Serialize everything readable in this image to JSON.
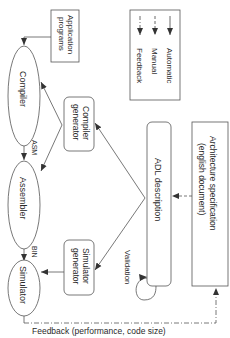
{
  "diagram": {
    "orientation": "rotated-90-clockwise",
    "nodes": {
      "application_programs": {
        "line1": "Application",
        "line2": "programs"
      },
      "compiler": {
        "label": "Compiler"
      },
      "assembler": {
        "label": "Assembler"
      },
      "simulator": {
        "label": "Simulator"
      },
      "compiler_generator": {
        "line1": "Compiler",
        "line2": "generator"
      },
      "simulator_generator": {
        "line1": "Simulator",
        "line2": "generator"
      },
      "adl_description": {
        "label": "ADL description"
      },
      "architecture_spec": {
        "line1": "Architecture specification",
        "line2": "(english document)"
      }
    },
    "edge_labels": {
      "asm": "ASM",
      "bin": "BIN",
      "validation": "Validation",
      "feedback": "Feedback (performance, code size)"
    },
    "legend": {
      "items": [
        {
          "label": "Automatic",
          "style": "solid"
        },
        {
          "label": "Manual",
          "style": "dashed"
        },
        {
          "label": "Feedback",
          "style": "dash-dot"
        }
      ]
    },
    "colors": {
      "stroke": "#555555",
      "text": "#2a2a2a",
      "background": "#ffffff"
    }
  }
}
